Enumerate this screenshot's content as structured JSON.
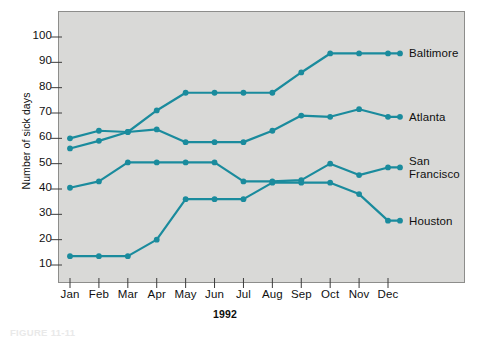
{
  "figure": {
    "caption": "FIGURE 11-11",
    "plot_bg_color": "#d9d9d7",
    "frame_color": "#8d8d8b",
    "series_color": "#1a8b9d"
  },
  "chart_data": {
    "type": "line",
    "title": "",
    "xlabel": "1992",
    "ylabel": "Number of sick days",
    "categories": [
      "Jan",
      "Feb",
      "Mar",
      "Apr",
      "May",
      "Jun",
      "Jul",
      "Aug",
      "Sep",
      "Oct",
      "Nov",
      "Dec"
    ],
    "ylim": [
      5,
      105
    ],
    "yticks": [
      10,
      20,
      30,
      40,
      50,
      60,
      70,
      80,
      90,
      100
    ],
    "grid": false,
    "legend_position": "right-inline",
    "markers": "circle",
    "series": [
      {
        "name": "Baltimore",
        "color": "#1a8b9d",
        "values": [
          56,
          59,
          62.5,
          71,
          78,
          78,
          78,
          78,
          86,
          93.5,
          93.5,
          93.5
        ]
      },
      {
        "name": "Atlanta",
        "color": "#1a8b9d",
        "values": [
          60,
          63,
          62.5,
          63.5,
          58.5,
          58.5,
          58.5,
          63,
          69,
          68.5,
          71.5,
          68.5
        ]
      },
      {
        "name": "San Francisco",
        "color": "#1a8b9d",
        "values": [
          40.5,
          43,
          50.5,
          50.5,
          50.5,
          50.5,
          43,
          43,
          43.5,
          50,
          45.5,
          48.5
        ]
      },
      {
        "name": "Houston",
        "color": "#1a8b9d",
        "values": [
          13.5,
          13.5,
          13.5,
          20,
          36,
          36,
          36,
          42.5,
          42.5,
          42.5,
          38,
          27.5
        ]
      }
    ],
    "series_label_text": [
      "Baltimore",
      "Atlanta",
      "San\nFrancisco",
      "Houston"
    ]
  }
}
